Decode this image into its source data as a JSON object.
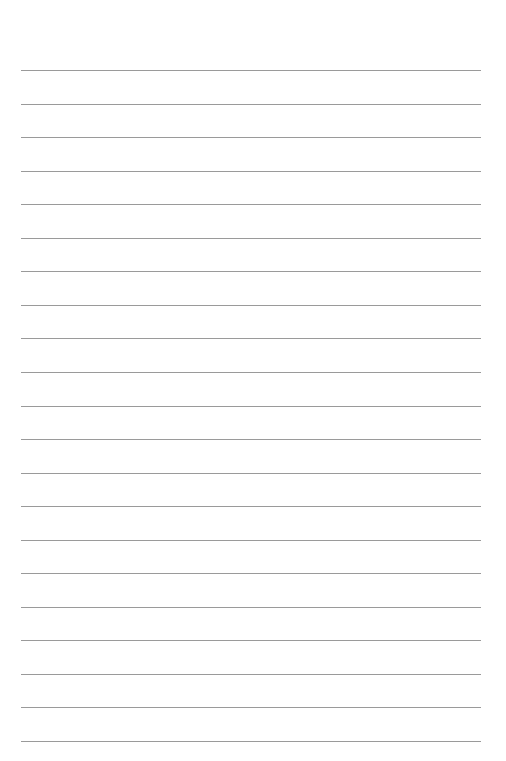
{
  "document": {
    "type": "lined-paper",
    "line_count": 21,
    "line_color": "#9a9a9a",
    "background_color": "#ffffff",
    "text_content": []
  }
}
